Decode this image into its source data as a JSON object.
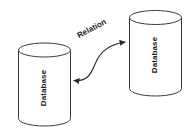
{
  "diagram": {
    "type": "entity-relationship-sketch",
    "background_color": "#ffffff",
    "stroke_color": "#3a3a3a",
    "text_color": "#1c1c1c",
    "nodes": [
      {
        "id": "database-left",
        "shape": "cylinder",
        "label": "Database",
        "label_rotation_deg": -90
      },
      {
        "id": "database-right",
        "shape": "cylinder",
        "label": "Database",
        "label_rotation_deg": -90
      }
    ],
    "edges": [
      {
        "id": "relation-edge",
        "label": "Relation",
        "label_rotation_deg": -28,
        "style": "curved",
        "arrowheads": "both",
        "from": "database-left",
        "to": "database-right"
      }
    ]
  }
}
